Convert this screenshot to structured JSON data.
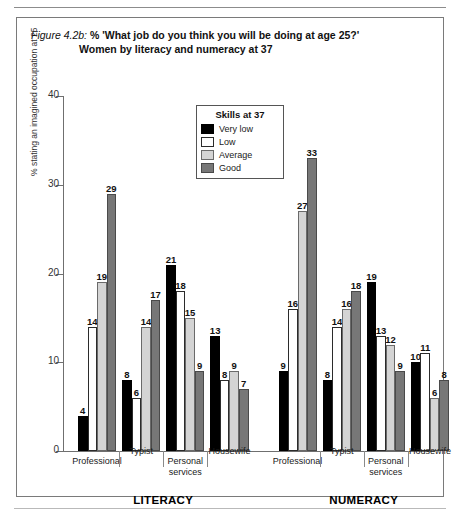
{
  "figure": {
    "caption_label": "Figure 4.2b:",
    "caption_question": "% 'What job do you think you will be doing at age 25?'",
    "caption_subtitle": "Women by literacy and numeracy at 37"
  },
  "legend": {
    "title": "Skills at 37",
    "entries": [
      {
        "label": "Very low",
        "color": "#000000",
        "key": "very-low"
      },
      {
        "label": "Low",
        "color": "#ffffff",
        "key": "low"
      },
      {
        "label": "Average",
        "color": "#d4d4d4",
        "key": "average"
      },
      {
        "label": "Good",
        "color": "#777777",
        "key": "good"
      }
    ]
  },
  "axis": {
    "y_label": "% stating an imagined occupation at 25",
    "y_ticks": [
      0,
      10,
      20,
      30,
      40
    ],
    "y_min": 0,
    "y_max": 40
  },
  "group_labels": [
    {
      "text": "LITERACY"
    },
    {
      "text": "NUMERACY"
    }
  ],
  "categories": [
    {
      "line1": "Professional",
      "line2": ""
    },
    {
      "line1": "Typist",
      "line2": ""
    },
    {
      "line1": "Personal",
      "line2": "services"
    },
    {
      "line1": "Housewife",
      "line2": ""
    }
  ],
  "chart_data": {
    "type": "bar",
    "title": "% 'What job do you think you will be doing at age 25?' Women by literacy and numeracy at 37",
    "xlabel": "",
    "ylabel": "% stating an imagined occupation at 25",
    "ylim": [
      0,
      40
    ],
    "yticks": [
      0,
      10,
      20,
      30,
      40
    ],
    "grid": false,
    "legend_title": "Skills at 37",
    "legend_position": "inside-top-center",
    "panels": [
      "LITERACY",
      "NUMERACY"
    ],
    "categories": [
      "Professional",
      "Typist",
      "Personal services",
      "Housewife"
    ],
    "series": [
      {
        "name": "Very low",
        "color": "#000000",
        "LITERACY": [
          4,
          8,
          21,
          13
        ],
        "NUMERACY": [
          9,
          8,
          19,
          10
        ]
      },
      {
        "name": "Low",
        "color": "#ffffff",
        "LITERACY": [
          14,
          6,
          18,
          8
        ],
        "NUMERACY": [
          16,
          14,
          13,
          11
        ]
      },
      {
        "name": "Average",
        "color": "#d4d4d4",
        "LITERACY": [
          19,
          14,
          15,
          9
        ],
        "NUMERACY": [
          27,
          16,
          12,
          6
        ]
      },
      {
        "name": "Good",
        "color": "#777777",
        "LITERACY": [
          29,
          17,
          9,
          7
        ],
        "NUMERACY": [
          33,
          18,
          9,
          8
        ]
      }
    ]
  }
}
